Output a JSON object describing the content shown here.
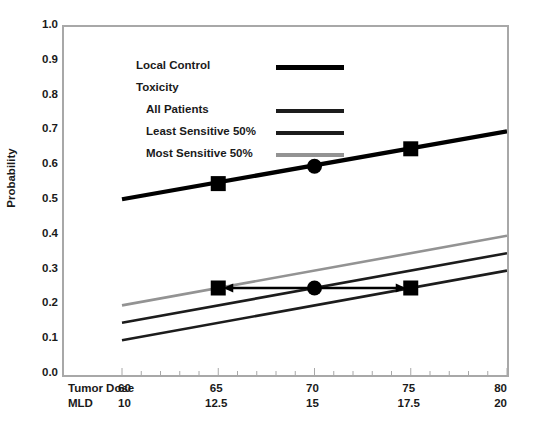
{
  "chart_data": {
    "type": "line",
    "title": "",
    "ylabel": "Probability",
    "ylim": [
      0.0,
      1.0
    ],
    "yticks": [
      "1.0",
      "0.9",
      "0.8",
      "0.7",
      "0.6",
      "0.5",
      "0.4",
      "0.3",
      "0.2",
      "0.1",
      "0.0"
    ],
    "ytick_values": [
      1.0,
      0.9,
      0.8,
      0.7,
      0.6,
      0.5,
      0.4,
      0.3,
      0.2,
      0.1,
      0.0
    ],
    "grid": false,
    "legend_position": "top-left inside axes",
    "x_axes": [
      {
        "name": "Tumor Dose",
        "ticks": [
          "60",
          "65",
          "70",
          "75",
          "80"
        ],
        "values": [
          60,
          65,
          70,
          75,
          80
        ],
        "xlim": [
          60,
          80
        ]
      },
      {
        "name": "MLD",
        "ticks": [
          "10",
          "12.5",
          "15",
          "17.5",
          "20"
        ],
        "values": [
          10,
          12.5,
          15,
          17.5,
          20
        ],
        "xlim": [
          10,
          20
        ]
      }
    ],
    "x": [
      60,
      80
    ],
    "series": [
      {
        "name": "Local Control",
        "values": [
          0.505,
          0.7
        ],
        "color": "#000000",
        "width": "thick"
      },
      {
        "name": "All Patients",
        "values": [
          0.15,
          0.35
        ],
        "color": "#1c1c1c",
        "width": "medium"
      },
      {
        "name": "Least Sensitive 50%",
        "values": [
          0.1,
          0.3
        ],
        "color": "#1c1c1c",
        "width": "medium"
      },
      {
        "name": "Most Sensitive 50%",
        "values": [
          0.2,
          0.4
        ],
        "color": "#939393",
        "width": "medium"
      }
    ],
    "markers": [
      {
        "series": "Local Control",
        "shape": "square",
        "x": 65,
        "y": 0.55
      },
      {
        "series": "Local Control",
        "shape": "circle",
        "x": 70,
        "y": 0.6
      },
      {
        "series": "Local Control",
        "shape": "square",
        "x": 75,
        "y": 0.65
      },
      {
        "series": "Toxicity",
        "shape": "square",
        "x": 65,
        "y": 0.25
      },
      {
        "series": "Toxicity",
        "shape": "circle",
        "x": 70,
        "y": 0.25
      },
      {
        "series": "Toxicity",
        "shape": "square",
        "x": 75,
        "y": 0.25
      }
    ],
    "annotations": [
      {
        "type": "double-headed-arrow",
        "y": 0.25,
        "x_start": 65,
        "x_end": 75,
        "color": "#000000"
      }
    ]
  },
  "legend": {
    "rows": [
      {
        "label": "Local Control",
        "swatch": "thick-black"
      },
      {
        "label": "Toxicity",
        "swatch": "none"
      },
      {
        "label": "All Patients",
        "swatch": "medium-black"
      },
      {
        "label": "Least Sensitive 50%",
        "swatch": "medium-black"
      },
      {
        "label": "Most Sensitive 50%",
        "swatch": "medium-gray"
      }
    ]
  },
  "colors": {
    "local_control": "#000000",
    "toxicity_all": "#1c1c1c",
    "toxicity_least": "#1c1c1c",
    "toxicity_most": "#939393",
    "frame": "#a8a8a8",
    "text": "#1a1a1a",
    "background": "#ffffff"
  }
}
